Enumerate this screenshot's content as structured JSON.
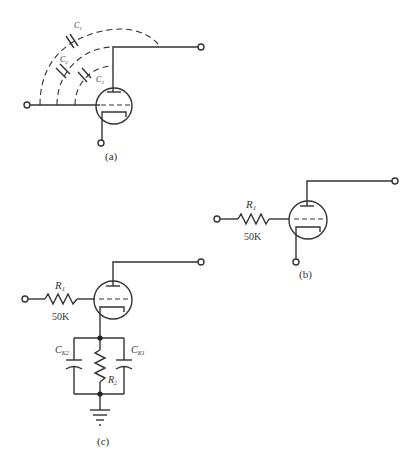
{
  "figures": {
    "a": {
      "caption": "(a)",
      "capacitors": [
        {
          "label": "C",
          "sub": "1"
        },
        {
          "label": "C",
          "sub": "2"
        },
        {
          "label": "C",
          "sub": "3"
        }
      ]
    },
    "b": {
      "caption": "(b)",
      "resistor": {
        "label": "R",
        "sub": "1",
        "value": "50K"
      }
    },
    "c": {
      "caption": "(c)",
      "resistor_in": {
        "label": "R",
        "sub": "1",
        "value": "50K"
      },
      "resistor_k": {
        "label": "R",
        "sub": "2"
      },
      "cap_left": {
        "label": "C",
        "sub": "K2"
      },
      "cap_right": {
        "label": "C",
        "sub": "K1"
      }
    }
  },
  "colors": {
    "ink": "#333333",
    "background": "#ffffff"
  }
}
